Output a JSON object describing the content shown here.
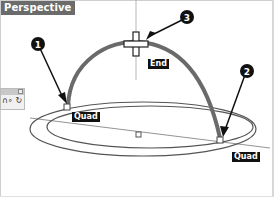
{
  "viewport": {
    "title": "Perspective"
  },
  "callouts": [
    {
      "number": "1"
    },
    {
      "number": "2"
    },
    {
      "number": "3"
    }
  ],
  "snap_labels": {
    "quad_left": "Quad",
    "quad_right": "Quad",
    "end": "End"
  },
  "toolbar": {
    "icons": "∩∘ ↻"
  },
  "colors": {
    "arc": "#666666",
    "callout_bg": "#111111",
    "title_bg": "#6b6b6b"
  }
}
